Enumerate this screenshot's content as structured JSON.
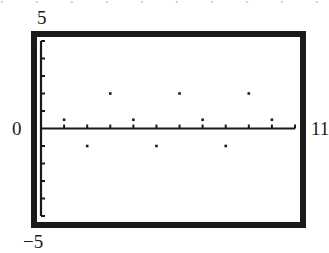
{
  "chart_data": {
    "type": "scatter",
    "title": "",
    "xlabel": "",
    "ylabel": "",
    "xlim": [
      0,
      11
    ],
    "ylim": [
      -5,
      5
    ],
    "grid": false,
    "legend": null,
    "axis_labels": {
      "y_max": "5",
      "y_min": "−5",
      "x_min": "0",
      "x_max": "11"
    },
    "x_ticks": [
      1,
      2,
      3,
      4,
      5,
      6,
      7,
      8,
      9,
      10,
      11
    ],
    "y_ticks": [
      -5,
      -4,
      -3,
      -2,
      -1,
      1,
      2,
      3,
      4,
      5
    ],
    "series": [
      {
        "name": "points",
        "x": [
          1,
          2,
          3,
          4,
          5,
          6,
          7,
          8,
          9,
          10
        ],
        "y": [
          0.5,
          -1,
          2,
          0.5,
          -1,
          2,
          0.5,
          -1,
          2,
          0.5
        ]
      }
    ],
    "style": {
      "frame_color": "#1a1a1a",
      "point_color": "#1a1a1a",
      "background": "#ffffff"
    }
  },
  "top_cutoff_text": ",   ,  ,   ,   ,  ,  ,   ,   ,  ,  ,"
}
